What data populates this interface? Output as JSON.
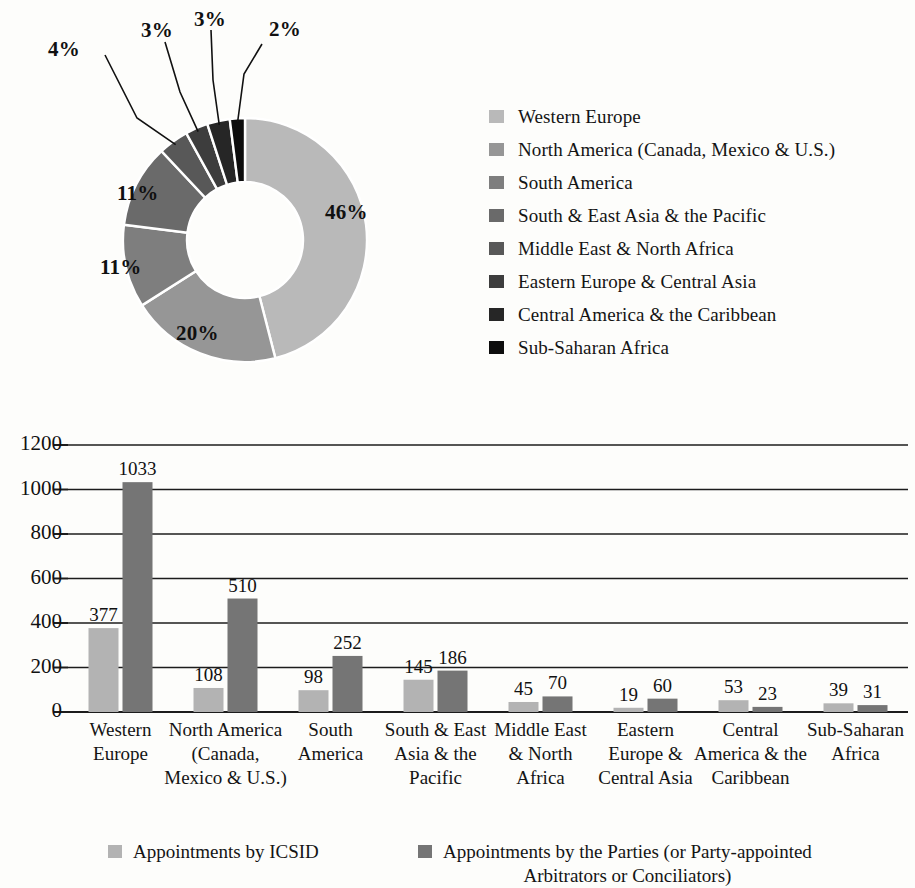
{
  "chart_data": [
    {
      "type": "pie",
      "title": "",
      "subtype": "donut",
      "labels": [
        "Western Europe",
        "North America (Canada, Mexico & U.S.)",
        "South America",
        "South & East Asia & the Pacific",
        "Middle East & North Africa",
        "Eastern Europe & Central Asia",
        "Central America & the Caribbean",
        "Sub-Saharan Africa"
      ],
      "values": [
        46,
        20,
        11,
        11,
        4,
        3,
        3,
        2
      ],
      "value_labels": [
        "46%",
        "20%",
        "11%",
        "11%",
        "4%",
        "3%",
        "3%",
        "2%"
      ],
      "colors": [
        "#b9b9b9",
        "#969696",
        "#7e7e7e",
        "#6a6a6a",
        "#585858",
        "#3d3d3d",
        "#262626",
        "#0d0d0d"
      ],
      "legend_position": "right",
      "grid": false
    },
    {
      "type": "bar",
      "title": "",
      "xlabel": "",
      "ylabel": "",
      "ylim": [
        0,
        1200
      ],
      "yticks": [
        0,
        200,
        400,
        600,
        800,
        1000,
        1200
      ],
      "ytick_labels": [
        "0",
        "200",
        "400",
        "600",
        "800",
        "1000",
        "1200"
      ],
      "grid": true,
      "legend_position": "bottom",
      "categories": [
        "Western Europe",
        "North America (Canada, Mexico & U.S.)",
        "South & East Asia & the Pacific",
        "South America",
        "Middle East & North Africa",
        "Eastern Europe & Central Asia",
        "Central America & the Caribbean",
        "Sub-Saharan Africa"
      ],
      "category_lines": [
        [
          "Western",
          "Europe"
        ],
        [
          "North America",
          "(Canada,",
          "Mexico & U.S.)"
        ],
        [
          "South",
          "America"
        ],
        [
          "South & East",
          "Asia & the",
          "Pacific"
        ],
        [
          "Middle East",
          "& North",
          "Africa"
        ],
        [
          "Eastern",
          "Europe &",
          "Central Asia"
        ],
        [
          "Central",
          "America & the",
          "Caribbean"
        ],
        [
          "Sub-Saharan",
          "Africa"
        ]
      ],
      "series": [
        {
          "name": "Appointments by ICSID",
          "color": "#b3b3b3",
          "values": [
            377,
            108,
            98,
            145,
            45,
            19,
            53,
            39
          ]
        },
        {
          "name": "Appointments by the Parties (or Party-appointed Arbitrators or Conciliators)",
          "color": "#757575",
          "values": [
            1033,
            510,
            252,
            186,
            70,
            60,
            23,
            31
          ]
        }
      ]
    }
  ],
  "pie": {
    "legend": [
      {
        "label": "Western Europe",
        "color": "#b9b9b9"
      },
      {
        "label": "North America (Canada, Mexico & U.S.)",
        "color": "#969696"
      },
      {
        "label": "South America",
        "color": "#7e7e7e"
      },
      {
        "label": "South & East Asia & the Pacific",
        "color": "#6a6a6a"
      },
      {
        "label": "Middle East & North Africa",
        "color": "#585858"
      },
      {
        "label": "Eastern Europe & Central Asia",
        "color": "#3d3d3d"
      },
      {
        "label": "Central America & the Caribbean",
        "color": "#262626"
      },
      {
        "label": "Sub-Saharan Africa",
        "color": "#0d0d0d"
      }
    ],
    "slice_labels": {
      "western_europe": "46%",
      "north_america": "20%",
      "south_america": "11%",
      "south_east_asia": "11%",
      "middle_east": "4%",
      "eastern_europe": "3%",
      "central_america": "3%",
      "sub_saharan": "2%"
    }
  },
  "bar": {
    "ytick_labels": [
      "1200",
      "1000",
      "800",
      "600",
      "400",
      "200",
      "0"
    ],
    "value_labels_icsid": [
      "377",
      "108",
      "98",
      "145",
      "45",
      "19",
      "53",
      "39"
    ],
    "value_labels_parties": [
      "1033",
      "510",
      "252",
      "186",
      "70",
      "60",
      "23",
      "31"
    ],
    "categories": [
      [
        "Western",
        "Europe"
      ],
      [
        "North America",
        "(Canada,",
        "Mexico & U.S.)"
      ],
      [
        "South",
        "America"
      ],
      [
        "South & East",
        "Asia & the",
        "Pacific"
      ],
      [
        "Middle East",
        "& North",
        "Africa"
      ],
      [
        "Eastern",
        "Europe &",
        "Central Asia"
      ],
      [
        "Central",
        "America & the",
        "Caribbean"
      ],
      [
        "Sub-Saharan",
        "Africa"
      ]
    ],
    "legend": {
      "series1": "Appointments by ICSID",
      "series2_line1": "Appointments by the Parties (or Party-appointed",
      "series2_line2": "Arbitrators or Conciliators)",
      "series1_color": "#b3b3b3",
      "series2_color": "#757575"
    }
  }
}
